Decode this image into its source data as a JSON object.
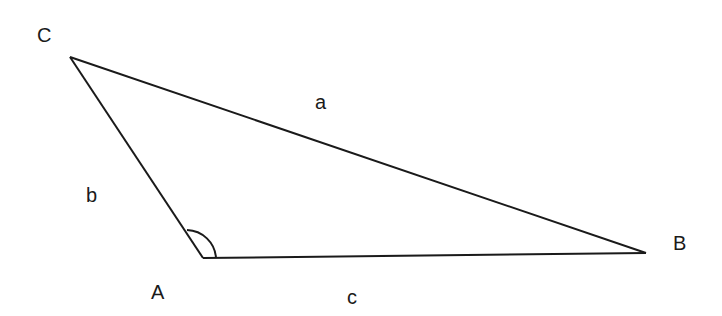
{
  "diagram": {
    "type": "triangle",
    "vertices": {
      "A": {
        "label": "A",
        "x": 203,
        "y": 258
      },
      "B": {
        "label": "B",
        "x": 646,
        "y": 253
      },
      "C": {
        "label": "C",
        "x": 70,
        "y": 57
      }
    },
    "sides": {
      "a": {
        "label": "a",
        "from": "B",
        "to": "C"
      },
      "b": {
        "label": "b",
        "from": "A",
        "to": "C"
      },
      "c": {
        "label": "c",
        "from": "A",
        "to": "B"
      }
    },
    "angle_marker": {
      "vertex": "A"
    },
    "colors": {
      "stroke": "#1a1a1a",
      "background": "#ffffff"
    }
  }
}
